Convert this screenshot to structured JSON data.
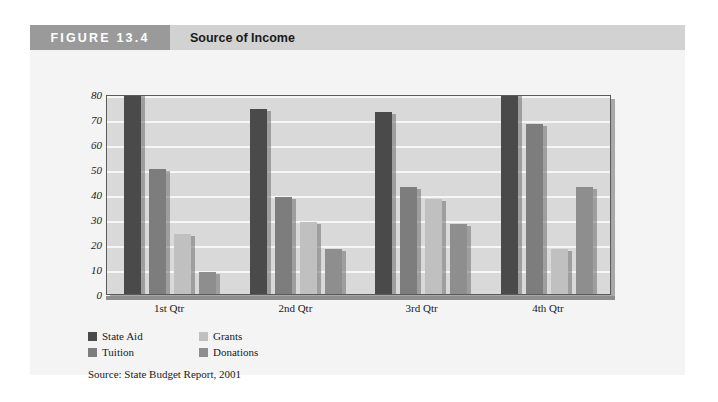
{
  "figure": {
    "number_label": "FIGURE 13.4",
    "title": "Source of Income",
    "number_band_color": "#9a9a9a",
    "title_band_color": "#d2d2d2",
    "card_background": "#f4f4f4"
  },
  "source_note": "Source: State Budget Report, 2001",
  "chart_data": {
    "type": "bar",
    "title": "Source of Income",
    "xlabel": "",
    "ylabel": "",
    "ylim": [
      0,
      80
    ],
    "yticks": [
      0,
      10,
      20,
      30,
      40,
      50,
      60,
      70,
      80
    ],
    "ytick_labels": [
      "0",
      "10",
      "20",
      "30",
      "40",
      "50",
      "60",
      "70",
      "80"
    ],
    "grid": true,
    "grid_color": "#f6f6f6",
    "plot_background": "#d9d9d9",
    "legend_position": "below-left",
    "categories": [
      "1st Qtr",
      "2nd Qtr",
      "3rd Qtr",
      "4th Qtr"
    ],
    "series": [
      {
        "name": "State Aid",
        "color": "#4a4a4a",
        "values": [
          80,
          74,
          73,
          80
        ]
      },
      {
        "name": "Tuition",
        "color": "#7d7d7d",
        "values": [
          50,
          39,
          43,
          68
        ]
      },
      {
        "name": "Grants",
        "color": "#c0c0c0",
        "values": [
          24,
          29,
          38,
          18
        ]
      },
      {
        "name": "Donations",
        "color": "#8e8e8e",
        "values": [
          9,
          18,
          28,
          43
        ]
      }
    ],
    "legend_order": [
      "State Aid",
      "Grants",
      "Tuition",
      "Donations"
    ]
  }
}
